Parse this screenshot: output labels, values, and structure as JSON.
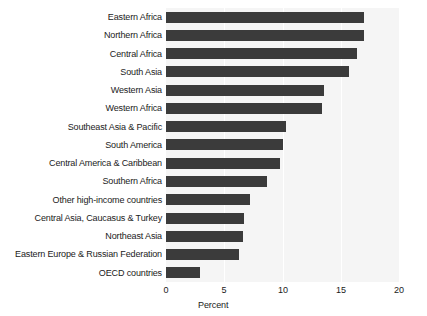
{
  "chart_data": {
    "type": "bar",
    "orientation": "horizontal",
    "title": "",
    "subtitle": "",
    "xlabel": "Percent",
    "ylabel": "",
    "xlim": [
      0,
      20
    ],
    "xticks": [
      0,
      5,
      10,
      15,
      20
    ],
    "xtick_labels": [
      "0",
      "5",
      "10",
      "15",
      "20"
    ],
    "grid": true,
    "grid_axis": "x",
    "legend": false,
    "legend_position": "none",
    "bar_color": "#3b3b3b",
    "plot_background": "#f5f5f5",
    "gridline_color": "#ffffff",
    "figure_background": "#ffffff",
    "categories": [
      "Eastern Africa",
      "Northern Africa",
      "Central Africa",
      "South Asia",
      "Western Asia",
      "Western Africa",
      "Southeast Asia & Pacific",
      "South America",
      "Central America & Caribbean",
      "Southern Africa",
      "Other high-income countries",
      "Central Asia, Caucasus & Turkey",
      "Northeast Asia",
      "Eastern Europe & Russian Federation",
      "OECD countries"
    ],
    "values": [
      17.0,
      17.0,
      16.4,
      15.7,
      13.6,
      13.4,
      10.3,
      10.0,
      9.8,
      8.7,
      7.2,
      6.7,
      6.6,
      6.3,
      2.9
    ]
  }
}
